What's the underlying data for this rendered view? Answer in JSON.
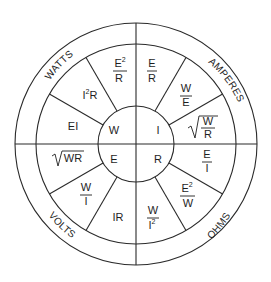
{
  "diagram": {
    "center_quadrants": {
      "top_left": "W",
      "top_right": "I",
      "bottom_left": "E",
      "bottom_right": "R"
    },
    "ring_labels": {
      "watts": "WATTS",
      "amperes": "AMPERES",
      "volts": "VOLTS",
      "ohms": "OHMS"
    },
    "formulas": {
      "watts": [
        {
          "text": "EI"
        },
        {
          "base": "I",
          "sup": "2",
          "rest": "R"
        },
        {
          "num": "E",
          "num_sup": "2",
          "den": "R"
        }
      ],
      "amperes": [
        {
          "num": "E",
          "den": "R"
        },
        {
          "num": "W",
          "den": "E"
        },
        {
          "sqrt": true,
          "num": "W",
          "den": "R"
        }
      ],
      "volts": [
        {
          "sqrt": true,
          "text": "WR"
        },
        {
          "num": "W",
          "den": "I"
        },
        {
          "text": "IR"
        }
      ],
      "ohms": [
        {
          "num": "W",
          "den": "I",
          "den_sup": "2"
        },
        {
          "num": "E",
          "num_sup": "2",
          "den": "W"
        },
        {
          "num": "E",
          "den": "I"
        }
      ]
    },
    "colors": {
      "line": "#2a2a2a",
      "text": "#1e1e1e",
      "background": "#ffffff"
    }
  }
}
